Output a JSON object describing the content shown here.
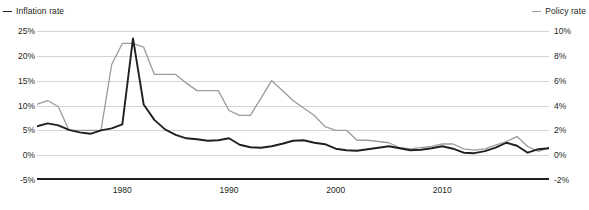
{
  "legend": {
    "left": {
      "label": "Inflation rate",
      "color": "#231f20"
    },
    "right": {
      "label": "Policy rate",
      "color": "#9b9b9b"
    }
  },
  "axes": {
    "left_ticks": [
      "25%",
      "20%",
      "15%",
      "10%",
      "5%",
      "0%",
      "-5%"
    ],
    "right_ticks": [
      "10%",
      "8%",
      "6%",
      "4%",
      "2%",
      "0%",
      "-2%"
    ],
    "x_ticks": [
      "1980",
      "1990",
      "2000",
      "2010"
    ]
  },
  "source_note": "",
  "chart_data": {
    "type": "line",
    "title": "",
    "subtitle": "",
    "xlabel": "",
    "ylabel": "",
    "grid": true,
    "legend_position": "top",
    "xlim": [
      1972,
      2020
    ],
    "x_tick_values": [
      1980,
      1990,
      2000,
      2010
    ],
    "axis_left": {
      "name": "Inflation rate",
      "ylabel": "",
      "ylim": [
        -5,
        25
      ],
      "ticks": [
        25,
        20,
        15,
        10,
        5,
        0,
        -5
      ],
      "unit": "%",
      "color": "#231f20"
    },
    "axis_right": {
      "name": "Policy rate",
      "ylabel": "",
      "ylim": [
        -2,
        10
      ],
      "ticks": [
        10,
        8,
        6,
        4,
        2,
        0,
        -2
      ],
      "unit": "%",
      "color": "#9b9b9b"
    },
    "x": [
      1972,
      1973,
      1974,
      1975,
      1976,
      1977,
      1978,
      1979,
      1980,
      1981,
      1982,
      1983,
      1984,
      1985,
      1986,
      1987,
      1988,
      1989,
      1990,
      1991,
      1992,
      1993,
      1994,
      1995,
      1996,
      1997,
      1998,
      1999,
      2000,
      2001,
      2002,
      2003,
      2004,
      2005,
      2006,
      2007,
      2008,
      2009,
      2010,
      2011,
      2012,
      2013,
      2014,
      2015,
      2016,
      2017,
      2018,
      2019,
      2020
    ],
    "series": [
      {
        "name": "Inflation rate",
        "axis": "left",
        "color": "#231f20",
        "unit": "%",
        "values": [
          5.8,
          6.4,
          6.0,
          5.1,
          4.6,
          4.3,
          5.0,
          5.4,
          6.2,
          23.5,
          10.2,
          7.1,
          5.2,
          4.1,
          3.4,
          3.2,
          2.9,
          3.0,
          3.4,
          2.1,
          1.6,
          1.5,
          1.8,
          2.3,
          2.9,
          3.0,
          2.5,
          2.2,
          1.3,
          1.0,
          0.9,
          1.2,
          1.5,
          1.8,
          1.4,
          1.0,
          1.1,
          1.4,
          1.8,
          1.3,
          0.5,
          0.4,
          0.8,
          1.5,
          2.5,
          1.9,
          0.5,
          1.2,
          1.4
        ]
      },
      {
        "name": "Policy rate",
        "axis": "right",
        "color": "#9b9b9b",
        "unit": "%",
        "values": [
          4.1,
          4.4,
          3.9,
          2.0,
          2.0,
          2.0,
          2.0,
          7.3,
          9.0,
          9.0,
          8.7,
          6.5,
          6.5,
          6.5,
          5.8,
          5.2,
          5.2,
          5.2,
          3.6,
          3.2,
          3.2,
          4.6,
          6.0,
          5.2,
          4.4,
          3.8,
          3.2,
          2.3,
          2.0,
          2.0,
          1.2,
          1.2,
          1.1,
          1.0,
          0.6,
          0.5,
          0.6,
          0.7,
          0.9,
          0.9,
          0.5,
          0.4,
          0.5,
          0.8,
          1.1,
          1.5,
          0.7,
          0.3,
          0.6
        ]
      }
    ]
  }
}
